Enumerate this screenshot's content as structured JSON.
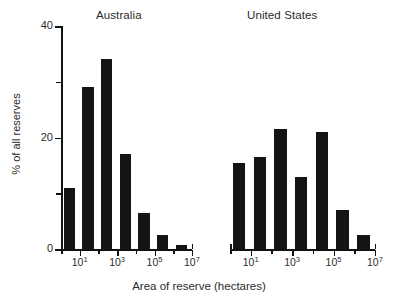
{
  "figure": {
    "xlabel": "Area of reserve (hectares)",
    "ylabel": "% of all reserves"
  },
  "panels": [
    {
      "title": "Australia"
    },
    {
      "title": "United States"
    }
  ],
  "axis": {
    "y_ticks_major": [
      "0",
      "20",
      "40"
    ],
    "y_minor_values": [
      10,
      30
    ],
    "y_min": 0,
    "y_max": 40,
    "x_tick_labels": [
      "10",
      "10",
      "10"
    ],
    "x_tick_exponents": [
      "1",
      "3",
      "5"
    ],
    "x_end_label": "10",
    "x_end_exponent": "7"
  },
  "chart_data": {
    "type": "bar",
    "title": "",
    "xlabel": "Area of reserve (hectares)",
    "ylabel": "% of all reserves",
    "ylim": [
      0,
      40
    ],
    "yticks": [
      0,
      20,
      40
    ],
    "yminorticks": [
      10,
      30
    ],
    "grid": false,
    "legend": "none",
    "xscale": "log",
    "xlim": [
      1,
      10000000
    ],
    "xticks": [
      10,
      1000,
      100000,
      10000000
    ],
    "xticklabels": [
      "10^1",
      "10^3",
      "10^5",
      "10^7"
    ],
    "panels": [
      {
        "name": "Australia",
        "categories": [
          "10^0-10^1",
          "10^1-10^2",
          "10^2-10^3",
          "10^3-10^4",
          "10^4-10^5",
          "10^5-10^6",
          "10^6-10^7"
        ],
        "values": [
          11,
          29,
          34,
          17,
          6.5,
          2.5,
          0.8
        ]
      },
      {
        "name": "United States",
        "categories": [
          "10^0-10^1",
          "10^1-10^2",
          "10^2-10^3",
          "10^3-10^4",
          "10^4-10^5",
          "10^5-10^6",
          "10^6-10^7"
        ],
        "values": [
          15.5,
          16.5,
          21.5,
          13,
          21,
          7,
          2.5
        ]
      }
    ]
  },
  "colors": {
    "bar": "#141414",
    "axis": "#111111",
    "text": "#2b2b2b",
    "background": "#ffffff"
  }
}
